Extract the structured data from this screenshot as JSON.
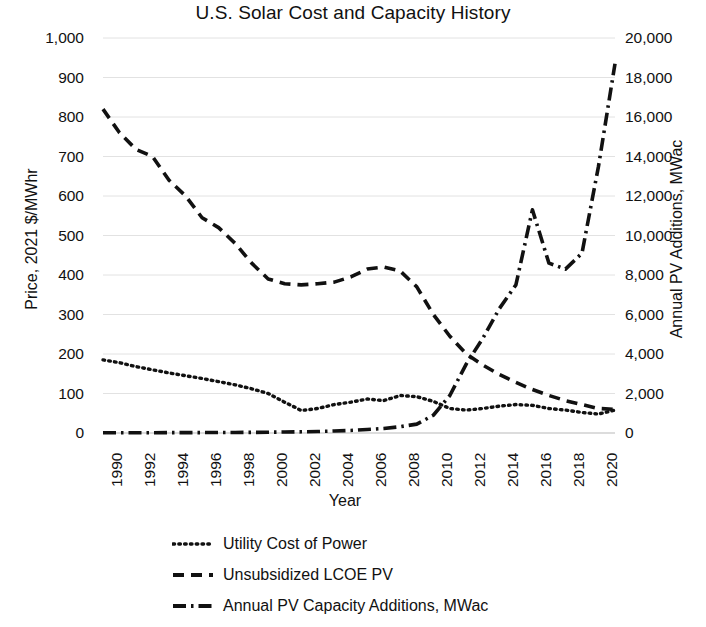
{
  "chart_data": {
    "type": "line",
    "title": "U.S. Solar Cost and Capacity History",
    "xlabel": "Year",
    "ylabel": "Price, 2021 $/MWhr",
    "y2label": "Annual PV Additions, MWac",
    "xlim": [
      1990,
      2021
    ],
    "ylim": [
      0,
      1000
    ],
    "y2lim": [
      0,
      20000
    ],
    "grid": true,
    "legend_position": "bottom",
    "x_tick_labels": [
      "1990",
      "1992",
      "1994",
      "1996",
      "1998",
      "2000",
      "2002",
      "2004",
      "2006",
      "2008",
      "2010",
      "2012",
      "2014",
      "2016",
      "2018",
      "2020"
    ],
    "x_tick_values": [
      1990,
      1992,
      1994,
      1996,
      1998,
      2000,
      2002,
      2004,
      2006,
      2008,
      2010,
      2012,
      2014,
      2016,
      2018,
      2020
    ],
    "y_tick_labels": [
      "0",
      "100",
      "200",
      "300",
      "400",
      "500",
      "600",
      "700",
      "800",
      "900",
      "1,000"
    ],
    "y_tick_values": [
      0,
      100,
      200,
      300,
      400,
      500,
      600,
      700,
      800,
      900,
      1000
    ],
    "y2_tick_labels": [
      "0",
      "2,000",
      "4,000",
      "6,000",
      "8,000",
      "10,000",
      "12,000",
      "14,000",
      "16,000",
      "18,000",
      "20,000"
    ],
    "y2_tick_values": [
      0,
      2000,
      4000,
      6000,
      8000,
      10000,
      12000,
      14000,
      16000,
      18000,
      20000
    ],
    "x": [
      1990,
      1991,
      1992,
      1993,
      1994,
      1995,
      1996,
      1997,
      1998,
      1999,
      2000,
      2001,
      2002,
      2003,
      2004,
      2005,
      2006,
      2007,
      2008,
      2009,
      2010,
      2011,
      2012,
      2013,
      2014,
      2015,
      2016,
      2017,
      2018,
      2019,
      2020,
      2021
    ],
    "series": [
      {
        "name": "Utility Cost of Power",
        "axis": "left",
        "style": "dotted",
        "color": "#111111",
        "values": [
          185,
          178,
          168,
          160,
          152,
          145,
          138,
          130,
          122,
          112,
          100,
          78,
          57,
          62,
          72,
          78,
          86,
          82,
          95,
          92,
          80,
          62,
          58,
          62,
          68,
          72,
          70,
          62,
          58,
          52,
          48,
          58
        ]
      },
      {
        "name": "Unsubsidized LCOE PV",
        "axis": "left",
        "style": "dashed",
        "color": "#111111",
        "values": [
          820,
          760,
          718,
          700,
          640,
          600,
          545,
          520,
          480,
          430,
          390,
          378,
          375,
          378,
          382,
          395,
          415,
          420,
          410,
          370,
          300,
          245,
          200,
          172,
          148,
          128,
          110,
          95,
          82,
          72,
          62,
          60
        ]
      },
      {
        "name": "Annual PV Capacity Additions, MWac",
        "axis": "right",
        "style": "dash-dot",
        "color": "#111111",
        "values": [
          10,
          12,
          14,
          15,
          18,
          20,
          22,
          25,
          28,
          32,
          40,
          50,
          60,
          75,
          100,
          130,
          180,
          230,
          320,
          450,
          900,
          1900,
          3500,
          4800,
          6300,
          7500,
          11300,
          8600,
          8300,
          9100,
          13500,
          18700
        ]
      }
    ]
  },
  "legend": {
    "items": [
      {
        "label": "Utility Cost of Power",
        "style": "dotted"
      },
      {
        "label": "Unsubsidized LCOE PV",
        "style": "dashed"
      },
      {
        "label": "Annual PV Capacity Additions, MWac",
        "style": "dash-dot"
      }
    ]
  }
}
